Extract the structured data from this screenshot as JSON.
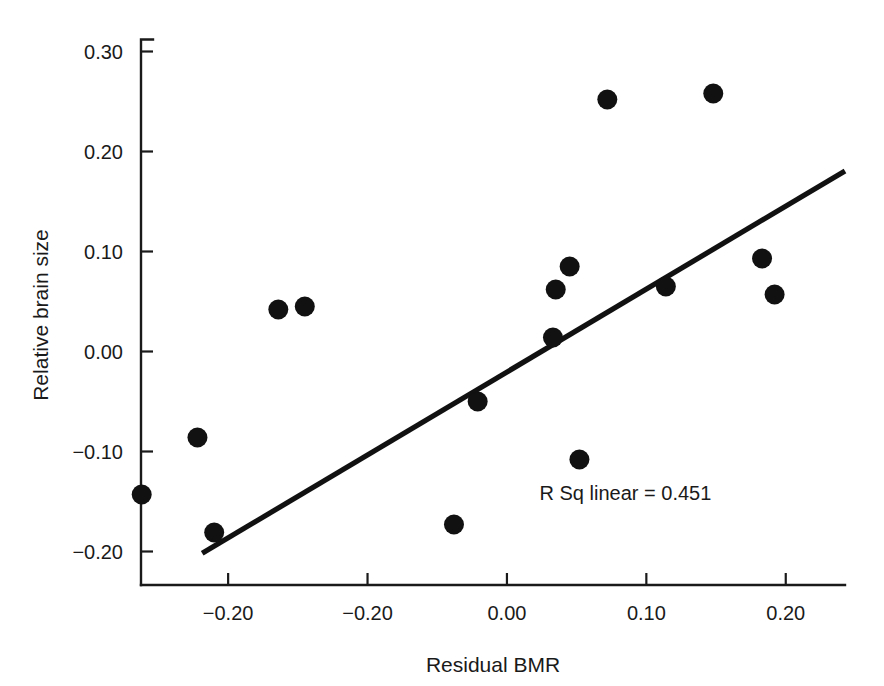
{
  "chart_data": {
    "type": "scatter",
    "title": "",
    "xlabel": "Residual BMR",
    "ylabel": "Relative brain size",
    "xlim": [
      -0.2625,
      0.2425
    ],
    "ylim": [
      -0.2335,
      0.3115
    ],
    "grid": false,
    "legend": null,
    "x_ticks": [
      -0.2,
      -0.1,
      0.0,
      0.1,
      0.2
    ],
    "x_tick_labels": [
      "−0.20",
      "−0.20",
      "0.00",
      "0.10",
      "0.20"
    ],
    "y_ticks": [
      0.3,
      0.2,
      0.1,
      0.0,
      -0.1,
      -0.2
    ],
    "y_tick_labels": [
      "0.30",
      "0.20",
      "0.10",
      "0.00",
      "−0.10",
      "−0.20"
    ],
    "annotations": [
      {
        "name": "r-squared-annotation",
        "text": "R Sq linear = 0.451",
        "x": 0.085,
        "y": -0.148
      }
    ],
    "fit_line": {
      "name": "linear-fit-line",
      "x": [
        -0.2186,
        0.2425
      ],
      "y": [
        -0.2018,
        0.1806
      ],
      "r_squared": 0.451
    },
    "points": [
      {
        "x": -0.262,
        "y": -0.143
      },
      {
        "x": -0.222,
        "y": -0.086
      },
      {
        "x": -0.21,
        "y": -0.181
      },
      {
        "x": -0.164,
        "y": 0.042
      },
      {
        "x": -0.145,
        "y": 0.045
      },
      {
        "x": -0.038,
        "y": -0.173
      },
      {
        "x": -0.021,
        "y": -0.05
      },
      {
        "x": 0.033,
        "y": 0.014
      },
      {
        "x": 0.035,
        "y": 0.062
      },
      {
        "x": 0.045,
        "y": 0.085
      },
      {
        "x": 0.052,
        "y": -0.108
      },
      {
        "x": 0.072,
        "y": 0.252
      },
      {
        "x": 0.114,
        "y": 0.065
      },
      {
        "x": 0.148,
        "y": 0.258
      },
      {
        "x": 0.183,
        "y": 0.093
      },
      {
        "x": 0.192,
        "y": 0.057
      }
    ],
    "marker": {
      "shape": "circle",
      "color": "#111111",
      "size_px": 20
    }
  }
}
